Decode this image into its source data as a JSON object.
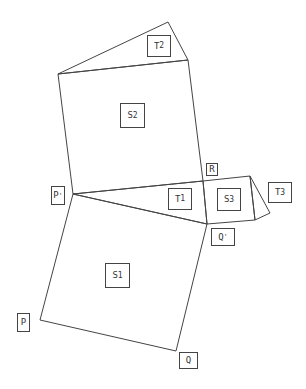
{
  "diagram": {
    "stroke_color": "#444444",
    "background": "#ffffff",
    "points": {
      "P": [
        40,
        320
      ],
      "Q": [
        176,
        351
      ],
      "P_prime": [
        73,
        194
      ],
      "Q_prime": [
        207,
        224
      ],
      "R": [
        203,
        181
      ],
      "S2_top_left": [
        58,
        74
      ],
      "S2_top_right": [
        188,
        60
      ],
      "T2_apex": [
        168,
        22
      ],
      "S3_top_right": [
        250,
        176
      ],
      "S3_bottom_right": [
        255,
        220
      ],
      "T3_apex": [
        270,
        213
      ]
    },
    "shapes": [
      {
        "name": "S1",
        "type": "square",
        "vertices": [
          "P",
          "Q",
          "Q_prime",
          "P_prime"
        ]
      },
      {
        "name": "S2",
        "type": "square",
        "vertices": [
          "S2_top_left",
          "S2_top_right",
          "R",
          "P_prime"
        ]
      },
      {
        "name": "S3",
        "type": "square",
        "vertices": [
          "R",
          "S3_top_right",
          "S3_bottom_right",
          "Q_prime"
        ]
      },
      {
        "name": "T1",
        "type": "triangle",
        "vertices": [
          "P_prime",
          "R",
          "Q_prime"
        ]
      },
      {
        "name": "T2",
        "type": "triangle",
        "vertices": [
          "S2_top_left",
          "T2_apex",
          "S2_top_right"
        ]
      },
      {
        "name": "T3",
        "type": "triangle",
        "vertices": [
          "S3_top_right",
          "T3_apex",
          "S3_bottom_right"
        ]
      }
    ],
    "labels": [
      {
        "id": "T2",
        "main": "T",
        "sub": "2",
        "sup": "",
        "box": [
          147,
          35,
          24,
          22
        ]
      },
      {
        "id": "S2",
        "main": "S",
        "sub": "2",
        "sup": "",
        "box": [
          120,
          103,
          25,
          25
        ]
      },
      {
        "id": "R",
        "main": "R",
        "sub": "",
        "sup": "",
        "box": [
          206,
          163,
          12,
          13
        ]
      },
      {
        "id": "P_prime",
        "main": "P",
        "sub": "",
        "sup": "'",
        "box": [
          51,
          186,
          14,
          19
        ]
      },
      {
        "id": "T1",
        "main": "T",
        "sub": "1",
        "sup": "",
        "box": [
          168,
          188,
          24,
          22
        ]
      },
      {
        "id": "S3",
        "main": "S",
        "sub": "3",
        "sup": "",
        "box": [
          217,
          188,
          24,
          23
        ]
      },
      {
        "id": "T3",
        "main": "T",
        "sub": "3",
        "sup": "",
        "box": [
          268,
          182,
          24,
          21
        ]
      },
      {
        "id": "Q_prime",
        "main": "Q",
        "sub": "",
        "sup": "'",
        "box": [
          211,
          228,
          24,
          18
        ]
      },
      {
        "id": "S1",
        "main": "S",
        "sub": "1",
        "sup": "",
        "box": [
          105,
          263,
          25,
          25
        ]
      },
      {
        "id": "P",
        "main": "P",
        "sub": "",
        "sup": "",
        "box": [
          17,
          313,
          13,
          19
        ]
      },
      {
        "id": "Q",
        "main": "Q",
        "sub": "",
        "sup": "",
        "box": [
          179,
          352,
          19,
          17
        ]
      }
    ]
  }
}
